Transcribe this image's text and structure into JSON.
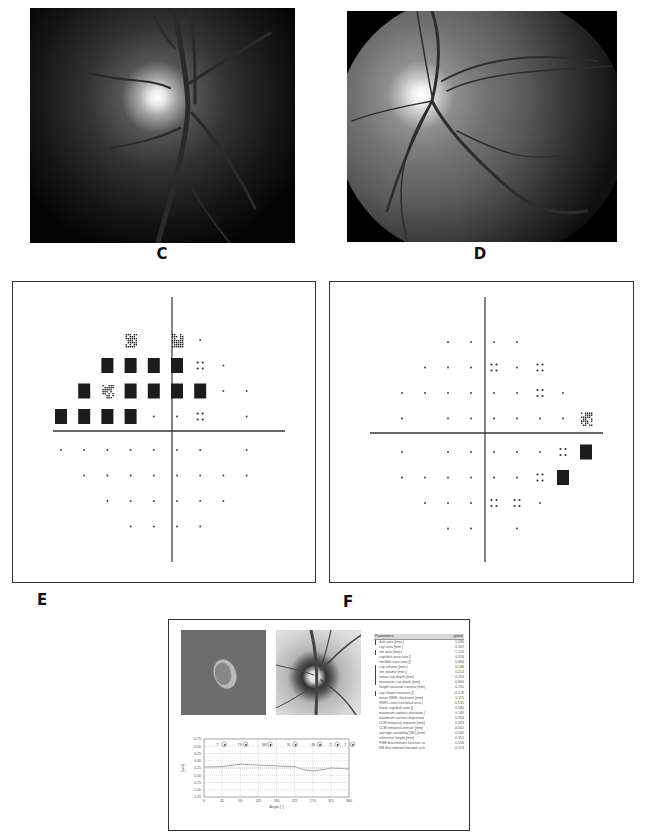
{
  "panels": {
    "C": {
      "label": "C",
      "type": "fundus-photograph",
      "description": "Optic disc photograph, red-free"
    },
    "D": {
      "label": "D",
      "type": "fundus-photograph",
      "description": "Wide-field fundus photograph with optic disc and macula"
    },
    "E": {
      "label": "E",
      "type": "visual-field-map",
      "description": "Visual field pattern deviation plot with superior defects"
    },
    "F": {
      "label": "F",
      "type": "visual-field-map",
      "description": "Visual field pattern deviation plot with nasal step defects"
    }
  },
  "visual_field_E": {
    "rows": [
      {
        "y": 0,
        "cells": [
          "",
          "",
          "",
          "hatch",
          "light",
          "hatch",
          "dot",
          "",
          "",
          ""
        ]
      },
      {
        "y": 1,
        "cells": [
          "",
          "",
          "black",
          "black",
          "black",
          "black",
          "quad",
          "dot",
          "",
          ""
        ]
      },
      {
        "y": 2,
        "cells": [
          "",
          "black",
          "hatch",
          "black",
          "black",
          "black",
          "black",
          "dot",
          "dot",
          ""
        ]
      },
      {
        "y": 3,
        "cells": [
          "black",
          "black",
          "black",
          "black",
          "dot",
          "dot",
          "quad",
          "",
          "dot",
          ""
        ]
      },
      {
        "y": 4,
        "cells": [
          "dot",
          "dot",
          "dot",
          "dot",
          "dot",
          "dot",
          "dot",
          "",
          "dot",
          ""
        ]
      },
      {
        "y": 5,
        "cells": [
          "",
          "dot",
          "dot",
          "dot",
          "dot",
          "dot",
          "dot",
          "dot",
          "dot",
          ""
        ]
      },
      {
        "y": 6,
        "cells": [
          "",
          "",
          "dot",
          "dot",
          "dot",
          "dot",
          "dot",
          "dot",
          "",
          ""
        ]
      },
      {
        "y": 7,
        "cells": [
          "",
          "",
          "",
          "dot",
          "dot",
          "dot",
          "dot",
          "",
          "",
          ""
        ]
      }
    ]
  },
  "visual_field_F": {
    "rows": [
      {
        "y": 0,
        "cells": [
          "",
          "",
          "dot",
          "dot",
          "dot",
          "dot",
          "",
          "",
          ""
        ]
      },
      {
        "y": 1,
        "cells": [
          "",
          "dot",
          "dot",
          "dot",
          "quad",
          "dot",
          "quad",
          "",
          ""
        ]
      },
      {
        "y": 2,
        "cells": [
          "dot",
          "dot",
          "dot",
          "dot",
          "dot",
          "dot",
          "quad",
          "dot",
          ""
        ]
      },
      {
        "y": 3,
        "cells": [
          "dot",
          "",
          "dot",
          "dot",
          "dot",
          "dot",
          "dot",
          "dot",
          "hatch"
        ]
      },
      {
        "y": 4,
        "cells": [
          "dot",
          "",
          "dot",
          "dot",
          "dot",
          "dot",
          "dot",
          "quad",
          "black"
        ]
      },
      {
        "y": 5,
        "cells": [
          "dot",
          "dot",
          "dot",
          "dot",
          "dot",
          "dot",
          "quad",
          "black",
          ""
        ]
      },
      {
        "y": 6,
        "cells": [
          "",
          "dot",
          "dot",
          "dot",
          "quad",
          "quad",
          "dot",
          "",
          ""
        ]
      },
      {
        "y": 7,
        "cells": [
          "",
          "",
          "dot",
          "dot",
          "light",
          "dot",
          "",
          "",
          ""
        ]
      }
    ]
  },
  "report": {
    "table": {
      "header": {
        "param": "Parameters",
        "col": "global"
      },
      "rows": [
        {
          "name": "disk area [mm²]",
          "value": "1.636",
          "mark": true
        },
        {
          "name": "cup area [mm²]",
          "value": "0.509",
          "mark": false
        },
        {
          "name": "rim area [mm²]",
          "value": "1.126",
          "mark": true
        },
        {
          "name": "cup/disk area ratio []",
          "value": "0.316",
          "mark": false
        },
        {
          "name": "rim/disk area ratio []",
          "value": "0.684",
          "mark": false
        },
        {
          "name": "cup volume [mm³]",
          "value": "0.148",
          "mark": true
        },
        {
          "name": "rim volume [mm³]",
          "value": "0.214",
          "mark": true
        },
        {
          "name": "mean cup depth [mm]",
          "value": "0.250",
          "mark": true
        },
        {
          "name": "maximum cup depth [mm]",
          "value": "0.600",
          "mark": true
        },
        {
          "name": "height variation contour [mm]",
          "value": "0.255",
          "mark": false
        },
        {
          "name": "cup shape measure []",
          "value": "-0.128",
          "mark": true
        },
        {
          "name": "mean RNFL thickness [mm]",
          "value": "0.115",
          "mark": false
        },
        {
          "name": "RNFL cross sectional area [",
          "value": "0.535",
          "mark": false
        },
        {
          "name": "linear cup/disk ratio []",
          "value": "0.580",
          "mark": false
        },
        {
          "name": "maximum contour elevation [",
          "value": "0.149",
          "mark": false
        },
        {
          "name": "maximum contour depressio",
          "value": "0.354",
          "mark": false
        },
        {
          "name": "CLM temporal-superior [mm]",
          "value": "0.093",
          "mark": false
        },
        {
          "name": "CLM temporal-inferior [mm]",
          "value": "-0.042",
          "mark": false
        },
        {
          "name": "average variability (SD) [mm]",
          "value": "0.040",
          "mark": false
        },
        {
          "name": "reference height [mm]",
          "value": "0.351",
          "mark": false
        },
        {
          "name": "FSM discriminant function va",
          "value": "0.156",
          "mark": false
        },
        {
          "name": "RB discriminant function valu",
          "value": "-0.574",
          "mark": false
        }
      ]
    }
  },
  "chart_data": {
    "type": "line",
    "title": "",
    "xlabel": "Angle [°]",
    "ylabel": "[mm]",
    "x_ticks": [
      0,
      45,
      90,
      135,
      180,
      225,
      270,
      315,
      360
    ],
    "y_ticks": [
      "0.75",
      "0.50",
      "0.25",
      "0.00",
      "-0.25",
      "-0.50",
      "-0.75",
      "-1.00",
      "-1.25"
    ],
    "y_tick_labels_visible": [
      "0.75",
      "0.50",
      "0.25",
      "0.00",
      "0.25",
      "0.50",
      "0.75",
      "1.00",
      "1.25"
    ],
    "xlim": [
      0,
      360
    ],
    "ylim": [
      -1.25,
      0.75
    ],
    "grid": true,
    "sector_labels": [
      "T",
      "TS",
      "NS",
      "N",
      "NI",
      "TI",
      "T"
    ],
    "series": [
      {
        "name": "height contour",
        "x": [
          0,
          45,
          90,
          135,
          180,
          225,
          250,
          270,
          300,
          315,
          360
        ],
        "values": [
          -0.22,
          -0.2,
          -0.12,
          -0.15,
          -0.18,
          -0.2,
          -0.32,
          -0.35,
          -0.3,
          -0.25,
          -0.28
        ]
      },
      {
        "name": "reference",
        "x": [
          0,
          360
        ],
        "values": [
          -0.25,
          -0.25
        ]
      }
    ]
  }
}
